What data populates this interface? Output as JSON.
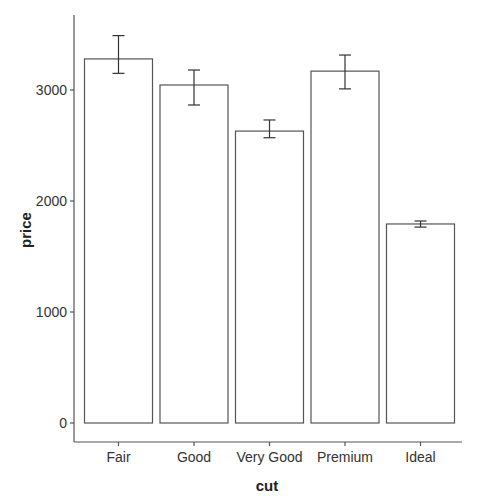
{
  "chart_data": {
    "type": "bar",
    "title": "",
    "xlabel": "cut",
    "ylabel": "price",
    "categories": [
      "Fair",
      "Good",
      "Very Good",
      "Premium",
      "Ideal"
    ],
    "values": [
      3280,
      3045,
      2630,
      3170,
      1793
    ],
    "error_bars": [
      {
        "low": 3150,
        "high": 3490
      },
      {
        "low": 2865,
        "high": 3180
      },
      {
        "low": 2570,
        "high": 2730
      },
      {
        "low": 3010,
        "high": 3315
      },
      {
        "low": 1765,
        "high": 1820
      }
    ],
    "yticks": [
      0,
      1000,
      2000,
      3000
    ],
    "ytick_labels": [
      "0",
      "1000",
      "2000",
      "3000"
    ],
    "ylim": [
      -100,
      3700
    ],
    "grid": false,
    "legend": null,
    "colors": {
      "bar_fill": "#ffffff",
      "bar_stroke": "#555555",
      "axis": "#555555"
    }
  }
}
